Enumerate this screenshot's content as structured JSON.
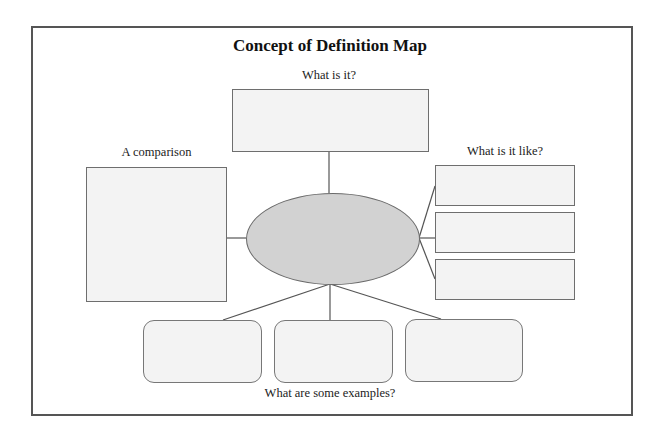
{
  "diagram": {
    "title": "Concept of Definition Map",
    "center": {
      "shape": "ellipse",
      "fill": "#d2d2d2",
      "text": ""
    },
    "sections": {
      "what_is_it": {
        "label": "What is it?",
        "boxes": 1
      },
      "comparison": {
        "label": "A comparison",
        "boxes": 1
      },
      "what_is_it_like": {
        "label": "What is it like?",
        "boxes": 3
      },
      "examples": {
        "label": "What are some examples?",
        "boxes": 3
      }
    },
    "colors": {
      "box_fill": "#f3f3f3",
      "border": "#6e6e6e",
      "frame": "#555555"
    }
  }
}
